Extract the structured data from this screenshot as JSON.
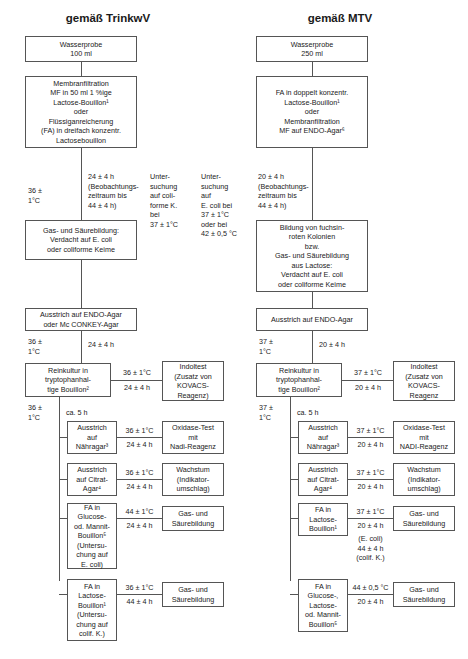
{
  "diagram": {
    "title_left": "gemäß TrinkwV",
    "title_right": "gemäß MTV",
    "left": {
      "sample": "Wasserprobe\n100 ml",
      "enrichment": "Membranfiltration\nMF in 50 ml 1 %ige\nLactose-Bouillon¹\noder\nFlüssiganreicherung\n(FA) in dreifach konzentr.\nLactosebouillon",
      "incub1_temp": "36 ±\n1°C",
      "incub1_time": "24 ± 4 h\n(Beobachtungs-\nzeitraum bis\n44 ± 4 h)",
      "presumptive": "Gas- und Säurebildung:\nVerdacht auf E. coli\noder coliforme Keime",
      "plating": "Ausstrich auf ENDO-Agar\noder Mc CONKEY-Agar",
      "incub2_temp": "36 ±\n1°C",
      "incub2_time": "24 ± 4 h",
      "pureculture": "Reinkultur in\ntryptophanhal-\ntige Bouillon²",
      "indol_temp": "36 ± 1°C",
      "indol_time": "24 ± 4 h",
      "indol": "Indoltest\n(Zusatz von\nKOVACS-\nReagenz)",
      "incub3_temp": "36 ±\n1°C",
      "incub3_time": "ca. 5 h",
      "tests": [
        {
          "name": "Ausstrich\nauf\nNähragar³",
          "temp": "36 ± 1°C",
          "time": "24 ± 4 h",
          "result": "Oxidase-Test\nmit\nNadi-Reagenz"
        },
        {
          "name": "Ausstrich\nauf Citrat-\nAgar⁴",
          "temp": "36 ± 1°C",
          "time": "24 ± 4 h",
          "result": "Wachstum\n(Indikator-\numschlag)"
        },
        {
          "name": "FA in\nGlucose-\nod. Mannit-\nBouillon⁵\n(Untersu-\nchung auf\nE. coli)",
          "temp": "44 ± 1°C",
          "time": "24 ± 4 h",
          "result": "Gas- und\nSäurebildung"
        },
        {
          "name": "FA in\nLactose-\nBouillon¹\n(Untersu-\nchung auf\ncolif. K.)",
          "temp": "36 ± 1°C",
          "time": "44 ± 4 h",
          "result": "Gas- und\nSäurebildung"
        }
      ]
    },
    "right": {
      "sample": "Wasserprobe\n250 ml",
      "enrichment": "FA in doppelt konzentr.\nLactose-Bouillon¹\noder\nMembranfiltration\nMF auf ENDO-Agar⁶",
      "note_colif": "Unter-\nsuchung\nauf coli-\nforme K.\nbei\n37 ± 1°C",
      "note_ecoli": "Unter-\nsuchung\nauf\nE. coli bei\n37 ± 1°C\noder bei\n42 ± 0,5 °C",
      "incub1_time": "20 ± 4 h\n(Beobachtungs-\nzeitraum bis\n44 ± 4 h)",
      "presumptive": "Bildung von fuchsin-\nroten Kolonien\nbzw.\nGas- und Säurebildung\naus Lactose:\nVerdacht auf E. coli\noder coliforme Keime",
      "plating": "Ausstrich auf ENDO-Agar",
      "incub2_temp": "37 ±\n1°C",
      "incub2_time": "20 ± 4 h",
      "pureculture": "Reinkultur in\ntryptophanhal-\ntige Bouillon²",
      "indol_temp": "37 ± 1°C",
      "indol_time": "20 ± 4 h",
      "indol": "Indoltest\n(Zusatz von\nKOVACS-\nReagenz",
      "incub3_temp": "37 ±\n1°C",
      "incub3_time": "ca. 5 h",
      "tests": [
        {
          "name": "Ausstrich\nauf\nNähragar³",
          "temp": "37 ± 1°C",
          "time": "20 ± 4 h",
          "result": "Oxidase-Test\nmit\nNADI-Reagenz"
        },
        {
          "name": "Ausstrich\nauf Citrat-\nAgar⁴",
          "temp": "37 ± 1°C",
          "time": "20 ± 4 h",
          "result": "Wachstum\n(Indikator-\numschlag)"
        },
        {
          "name": "FA in\nLactose-\nBouillon¹",
          "temp": "37 ± 1°C",
          "time": "20 ± 4 h",
          "extra": "(E. coli)\n44 ± 4 h\n(colif. K.)",
          "result": "Gas- und\nSäurebildung"
        },
        {
          "name": "FA in\nGlucose-,\nLactose-\nod. Mannit-\nBouillon⁵",
          "temp": "44 ± 0,5 °C",
          "time": "20 ± 4 h",
          "result": "Gas- und\nSäurebildung"
        }
      ]
    }
  }
}
